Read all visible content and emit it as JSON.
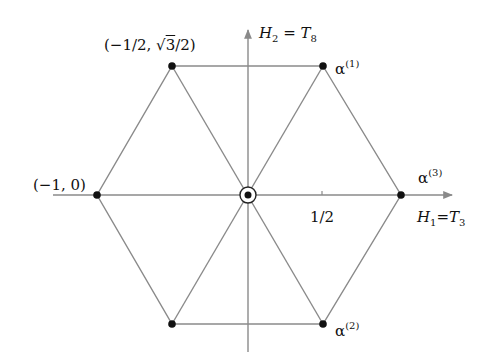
{
  "diagram": {
    "colors": {
      "line": "#8a8a8a",
      "axis": "#8a8a8a",
      "point": "#111111",
      "text": "#111111",
      "background": "#ffffff"
    },
    "axes": {
      "horizontal": {
        "label_main": "H",
        "label_sub": "1",
        "label_eq": "=",
        "label_rhs": "T",
        "label_rhs_sub": "3",
        "tick_label": "1/2"
      },
      "vertical": {
        "label_main": "H",
        "label_sub": "2",
        "label_eq": " = ",
        "label_rhs": "T",
        "label_rhs_sub": "8"
      }
    },
    "points": [
      {
        "name": "alpha-1",
        "coords": "(1/2, √3/2)",
        "label_greek": "α",
        "label_sup": "(1)"
      },
      {
        "name": "alpha-3",
        "coords": "(1, 0)",
        "label_greek": "α",
        "label_sup": "(3)"
      },
      {
        "name": "alpha-2",
        "coords": "(1/2, -√3/2)",
        "label_greek": "α",
        "label_sup": "(2)"
      },
      {
        "name": "minus-alpha-3",
        "coords": "(-1, 0)",
        "label_text": "(−1, 0)"
      },
      {
        "name": "minus-alpha-2",
        "coords": "(-1/2, √3/2)",
        "label_prefix": "(−1/2, √",
        "label_root": "3",
        "label_suffix": "/2)"
      },
      {
        "name": "minus-alpha-1",
        "coords": "(-1/2, -√3/2)"
      },
      {
        "name": "origin",
        "coords": "(0, 0)",
        "marker": "double-circle"
      }
    ]
  }
}
